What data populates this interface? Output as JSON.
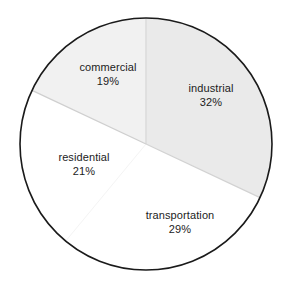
{
  "chart_data": {
    "type": "pie",
    "title": "",
    "subtitle": "",
    "xlabel": "",
    "ylabel": "",
    "grid": false,
    "legend": "none",
    "labels_inside_slices": true,
    "start_angle_deg": 0,
    "direction": "clockwise",
    "categories": [
      "industrial",
      "transportation",
      "residential",
      "commercial"
    ],
    "values": [
      32,
      29,
      21,
      19
    ],
    "unit": "%",
    "total": 101,
    "slices": [
      {
        "label": "industrial",
        "value": 32,
        "value_text": "32%",
        "fill": "#eaeaea",
        "start_deg": 0.0,
        "end_deg": 115.2
      },
      {
        "label": "transportation",
        "value": 29,
        "value_text": "29%",
        "fill": "#ffffff",
        "start_deg": 115.2,
        "end_deg": 219.6
      },
      {
        "label": "residential",
        "value": 21,
        "value_text": "21%",
        "fill": "#ffffff",
        "start_deg": 219.6,
        "end_deg": 295.2
      },
      {
        "label": "commercial",
        "value": 19,
        "value_text": "19%",
        "fill": "#f1f1f1",
        "start_deg": 295.2,
        "end_deg": 360.0
      }
    ]
  },
  "colors": {
    "outline": "#1a1a1a",
    "divider": "#d8d8d8",
    "background": "#ffffff",
    "text": "#1c1c1c",
    "industrial_fill": "#eaeaea",
    "commercial_fill": "#f1f1f1",
    "residential_fill": "#ffffff",
    "transportation_fill": "#ffffff"
  },
  "geometry": {
    "center_x": 146,
    "center_y": 144,
    "radius": 126
  }
}
